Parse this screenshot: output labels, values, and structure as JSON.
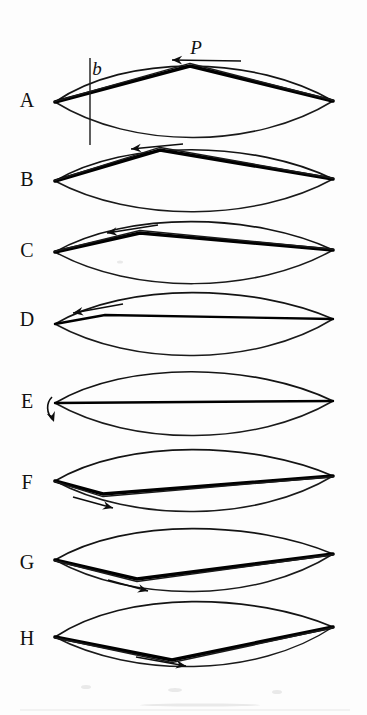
{
  "figure": {
    "width": 367,
    "height": 715,
    "background_color": "#fdfdfd",
    "ink_color": "#111111"
  },
  "annotations": {
    "load_label": "P",
    "load_label_name": "applied-load-P",
    "width_label": "b",
    "width_label_name": "width-dimension-b"
  },
  "panels": [
    {
      "label": "A",
      "label_x": 27,
      "label_y": 102,
      "left_vertex": [
        55,
        102
      ],
      "right_vertex": [
        333,
        101
      ],
      "upper_curve_peak_y": 64,
      "lower_curve_peak_y": 139,
      "kink_x": 190,
      "kink_y": 66,
      "rod_style": "thick-kinked-up",
      "arrow": {
        "type": "straight",
        "direction": "left",
        "x1": 241,
        "y1": 61,
        "x2": 172,
        "y2": 60
      },
      "has_ref_line": true,
      "ref_line_x": 90,
      "ref_line_y1": 58,
      "ref_line_y2": 145
    },
    {
      "label": "B",
      "label_x": 27,
      "label_y": 181,
      "left_vertex": [
        55,
        181
      ],
      "right_vertex": [
        333,
        179
      ],
      "upper_curve_peak_y": 148,
      "lower_curve_peak_y": 213,
      "kink_x": 160,
      "kink_y": 150,
      "rod_style": "thick-kinked-up",
      "arrow": {
        "type": "straight",
        "direction": "left",
        "x1": 183,
        "y1": 144,
        "x2": 131,
        "y2": 149
      },
      "has_ref_line": false
    },
    {
      "label": "C",
      "label_x": 27,
      "label_y": 252,
      "left_vertex": [
        55,
        252
      ],
      "right_vertex": [
        333,
        250
      ],
      "upper_curve_peak_y": 220,
      "lower_curve_peak_y": 285,
      "kink_x": 140,
      "kink_y": 233,
      "rod_style": "thick-kinked-up",
      "arrow": {
        "type": "straight",
        "direction": "left",
        "x1": 158,
        "y1": 225,
        "x2": 107,
        "y2": 233
      },
      "has_ref_line": false
    },
    {
      "label": "D",
      "label_x": 27,
      "label_y": 321,
      "left_vertex": [
        55,
        324
      ],
      "right_vertex": [
        333,
        319
      ],
      "upper_curve_peak_y": 291,
      "lower_curve_peak_y": 357,
      "kink_x": 105,
      "kink_y": 315,
      "rod_style": "thin-near-straight",
      "arrow": {
        "type": "straight",
        "direction": "left",
        "x1": 123,
        "y1": 304,
        "x2": 73,
        "y2": 313
      },
      "has_ref_line": false
    },
    {
      "label": "E",
      "label_x": 27,
      "label_y": 403,
      "left_vertex": [
        55,
        403
      ],
      "right_vertex": [
        333,
        401
      ],
      "upper_curve_peak_y": 370,
      "lower_curve_peak_y": 437,
      "kink_x": 55,
      "kink_y": 403,
      "rod_style": "straight",
      "arrow": {
        "type": "hook",
        "direction": "down-left"
      },
      "has_ref_line": false
    },
    {
      "label": "F",
      "label_x": 27,
      "label_y": 484,
      "left_vertex": [
        55,
        481
      ],
      "right_vertex": [
        333,
        476
      ],
      "upper_curve_peak_y": 448,
      "lower_curve_peak_y": 513,
      "kink_x": 103,
      "kink_y": 494,
      "rod_style": "thick-kinked-down",
      "arrow": {
        "type": "straight",
        "direction": "right",
        "x1": 73,
        "y1": 497,
        "x2": 113,
        "y2": 508
      },
      "has_ref_line": false
    },
    {
      "label": "G",
      "label_x": 27,
      "label_y": 564,
      "left_vertex": [
        55,
        560
      ],
      "right_vertex": [
        333,
        554
      ],
      "upper_curve_peak_y": 527,
      "lower_curve_peak_y": 593,
      "kink_x": 137,
      "kink_y": 579,
      "rod_style": "thick-kinked-down",
      "arrow": {
        "type": "straight",
        "direction": "right",
        "x1": 108,
        "y1": 580,
        "x2": 148,
        "y2": 591
      },
      "has_ref_line": false
    },
    {
      "label": "H",
      "label_x": 27,
      "label_y": 640,
      "left_vertex": [
        55,
        637
      ],
      "right_vertex": [
        333,
        627
      ],
      "upper_curve_peak_y": 600,
      "lower_curve_peak_y": 668,
      "kink_x": 172,
      "kink_y": 660,
      "rod_style": "thick-kinked-down",
      "arrow": {
        "type": "straight",
        "direction": "right",
        "x1": 136,
        "y1": 657,
        "x2": 186,
        "y2": 666
      },
      "has_ref_line": false
    }
  ]
}
